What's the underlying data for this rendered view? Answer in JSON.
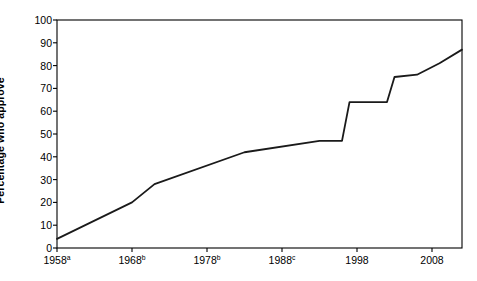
{
  "chart_data": {
    "type": "line",
    "title": "",
    "xlabel": "",
    "ylabel": "Percentage who approve",
    "xlim": [
      1958,
      2012
    ],
    "ylim": [
      0,
      100
    ],
    "grid": false,
    "legend": "none",
    "y_ticks": [
      0,
      10,
      20,
      30,
      40,
      50,
      60,
      70,
      80,
      90,
      100
    ],
    "y_tick_labels": [
      "0",
      "10",
      "20",
      "30",
      "40",
      "50",
      "60",
      "70",
      "80",
      "90",
      "100"
    ],
    "x_ticks": [
      1958,
      1968,
      1978,
      1988,
      1998,
      2008
    ],
    "x_tick_labels": [
      "1958",
      "1968",
      "1978",
      "1988",
      "1998",
      "2008"
    ],
    "x_tick_footnotes": [
      "a",
      "b",
      "b",
      "c",
      "",
      ""
    ],
    "series": [
      {
        "name": "Percentage who approve",
        "color": "#1a1a1a",
        "x": [
          1958,
          1968,
          1971,
          1983,
          1993,
          1996,
          1997,
          2002,
          2003,
          2006,
          2009,
          2012
        ],
        "y": [
          4,
          20,
          28,
          42,
          47,
          47,
          64,
          64,
          75,
          76,
          81,
          87
        ]
      }
    ]
  },
  "axes": {
    "line_color": "#000000",
    "plot_background": "#ffffff"
  }
}
